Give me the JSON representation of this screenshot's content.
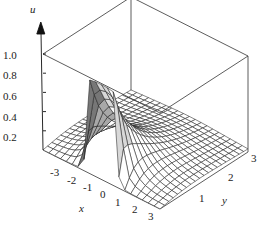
{
  "chart_data": {
    "type": "surface3d",
    "title": "",
    "xlabel": "x",
    "ylabel": "y",
    "zlabel": "u",
    "x_ticks": [
      "-3",
      "-2",
      "-1",
      "0",
      "1",
      "2",
      "3"
    ],
    "y_ticks": [
      "1",
      "2",
      "3"
    ],
    "z_ticks": [
      "0.2",
      "0.4",
      "0.6",
      "0.8",
      "1.0"
    ],
    "xlim": [
      -3.5,
      3.5
    ],
    "ylim": [
      0,
      3.5
    ],
    "zlim": [
      0,
      1.0
    ],
    "grid_resolution": 20,
    "colors": {
      "line": "#222222",
      "fill": "#ffffff",
      "shade_dark": "#777777",
      "shade_mid": "#a8a8a8",
      "shade_light": "#d8d8d8"
    }
  },
  "axes": {
    "u_label": "u",
    "x_label": "x",
    "y_label": "y",
    "z_tick_labels": [
      {
        "text": "1.0",
        "left": 3,
        "top": 50
      },
      {
        "text": "0.8",
        "left": 3,
        "top": 70
      },
      {
        "text": "0.6",
        "left": 3,
        "top": 91
      },
      {
        "text": "0.4",
        "left": 3,
        "top": 112
      },
      {
        "text": "0.2",
        "left": 3,
        "top": 132
      }
    ],
    "x_tick_labels": [
      {
        "text": "-3",
        "left": 50,
        "top": 167
      },
      {
        "text": "-2",
        "left": 67,
        "top": 175
      },
      {
        "text": "-1",
        "left": 83,
        "top": 182
      },
      {
        "text": "0",
        "left": 100,
        "top": 189
      },
      {
        "text": "1",
        "left": 115,
        "top": 197
      },
      {
        "text": "2",
        "left": 132,
        "top": 204
      },
      {
        "text": "3",
        "left": 148,
        "top": 211
      }
    ],
    "y_tick_labels": [
      {
        "text": "1",
        "left": 199,
        "top": 193
      },
      {
        "text": "2",
        "left": 228,
        "top": 172
      },
      {
        "text": "3",
        "left": 251,
        "top": 153
      }
    ],
    "x_axis_label_pos": {
      "left": 79,
      "top": 203
    },
    "y_axis_label_pos": {
      "left": 222,
      "top": 195
    },
    "u_axis_label_pos": {
      "left": 30,
      "top": 4
    }
  }
}
